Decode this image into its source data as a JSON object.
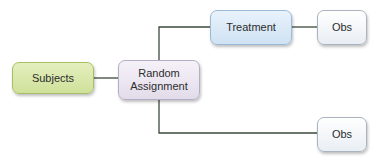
{
  "diagram": {
    "nodes": {
      "subjects": "Subjects",
      "random_assignment_line1": "Random",
      "random_assignment_line2": "Assignment",
      "treatment": "Treatment",
      "obs_treatment": "Obs",
      "obs_control": "Obs"
    },
    "edges": [
      {
        "from": "Subjects",
        "to": "Random Assignment"
      },
      {
        "from": "Random Assignment",
        "to": "Treatment"
      },
      {
        "from": "Treatment",
        "to": "Obs"
      },
      {
        "from": "Random Assignment",
        "to": "Obs (control)"
      }
    ],
    "colors": {
      "subjects_fill": "#d8e7aa",
      "random_fill": "#e9e4ef",
      "treatment_fill": "#dbe9f6",
      "obs_fill": "#f2f5f8",
      "line": "#3c4a3c"
    }
  }
}
